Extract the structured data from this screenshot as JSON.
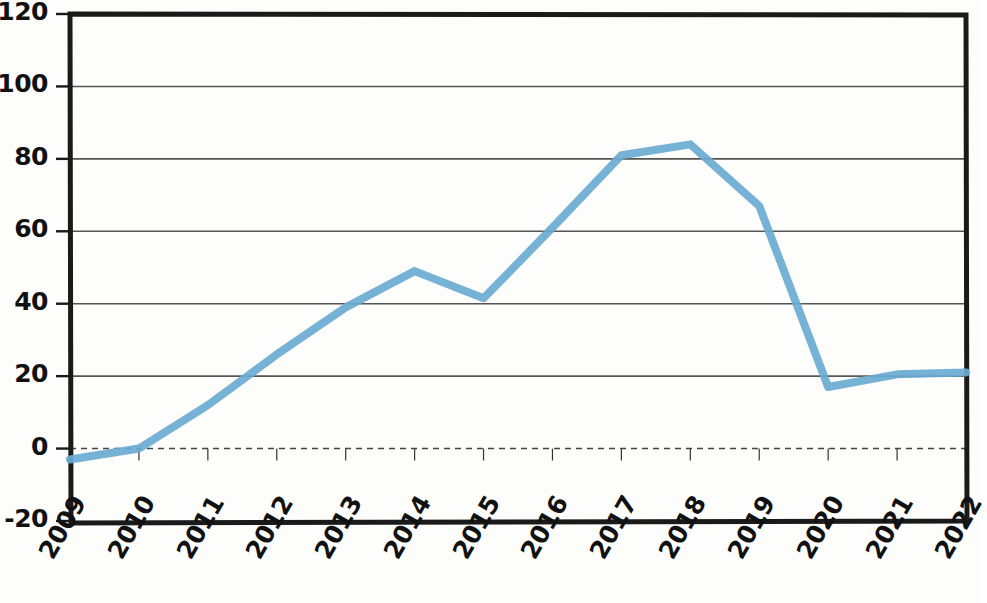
{
  "chart_data": {
    "type": "line",
    "title": "",
    "subtitle": "",
    "xlabel": "",
    "ylabel": "",
    "categories": [
      "2009",
      "2010",
      "2011",
      "2012",
      "2013",
      "2014",
      "2015",
      "2016",
      "2017",
      "2018",
      "2019",
      "2020",
      "2021",
      "2022"
    ],
    "x": [
      2009,
      2010,
      2011,
      2012,
      2013,
      2014,
      2015,
      2016,
      2017,
      2018,
      2019,
      2020,
      2021,
      2022
    ],
    "series": [
      {
        "name": "series-1",
        "color": "#6aabd2",
        "values": [
          -3,
          0,
          12,
          26,
          39,
          49,
          41.5,
          61,
          81,
          84,
          67,
          17,
          20.5,
          21
        ]
      }
    ],
    "values": [
      -3,
      0,
      12,
      26,
      39,
      49,
      41.5,
      61,
      81,
      84,
      67,
      17,
      20.5,
      21
    ],
    "ylim": [
      -20,
      120
    ],
    "xlim": [
      2009,
      2022
    ],
    "yticks": [
      120,
      100,
      80,
      60,
      40,
      20,
      0,
      -20
    ],
    "ytick_labels": [
      "120",
      "100",
      "80",
      "60",
      "40",
      "20",
      "0",
      "-20"
    ],
    "xtick_labels": [
      "2009",
      "2010",
      "2011",
      "2012",
      "2013",
      "2014",
      "2015",
      "2016",
      "2017",
      "2018",
      "2019",
      "2020",
      "2021",
      "2022"
    ],
    "grid": "horizontal",
    "gridlines_at": [
      100,
      80,
      60,
      40,
      20
    ],
    "zero_line": {
      "value": 0,
      "style": "dashed",
      "color": "#444444"
    },
    "legend": null,
    "legend_position": "none",
    "annotations": [],
    "axis_color": "#1a1a1a",
    "gridline_color": "#555555",
    "background_color": "#fdfdfc",
    "plot_border": "box"
  }
}
